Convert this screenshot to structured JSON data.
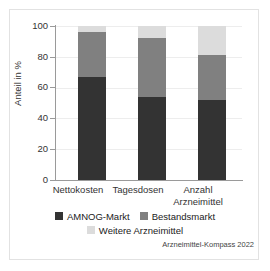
{
  "chart_data": {
    "type": "bar",
    "stacked": true,
    "title": "",
    "xlabel": "",
    "ylabel": "Anteil in %",
    "ylim": [
      0,
      100
    ],
    "yticks": [
      0,
      20,
      40,
      60,
      80,
      100
    ],
    "ytick_labels": [
      "0",
      "20",
      "40",
      "60",
      "80",
      "100"
    ],
    "grid": true,
    "legend_position": "bottom",
    "categories": [
      "Nettokosten",
      "Tagesdosen",
      "Anzahl Arzneimittel"
    ],
    "category_lines": [
      [
        "Nettokosten"
      ],
      [
        "Tagesdosen"
      ],
      [
        "Anzahl",
        "Arzneimittel"
      ]
    ],
    "series": [
      {
        "name": "AMNOG-Markt",
        "color": "#333333",
        "values": [
          67,
          54,
          52
        ]
      },
      {
        "name": "Bestandsmarkt",
        "color": "#808080",
        "values": [
          29,
          38,
          29
        ]
      },
      {
        "name": "Weitere Arzneimittel",
        "color": "#dcdcdc",
        "values": [
          4,
          8,
          19
        ]
      }
    ],
    "cumulative_tops": [
      [
        67,
        96,
        100
      ],
      [
        54,
        92,
        100
      ],
      [
        52,
        81,
        100
      ]
    ],
    "source": "Arzneimittel-Kompass 2022"
  },
  "colors": {
    "amnog_markt": "#333333",
    "bestandsmarkt": "#808080",
    "weitere_arzneimittel": "#dcdcdc",
    "axis": "#9a9a9a",
    "grid": "#ededed",
    "frame": "#e2e2e2",
    "background": "#ffffff"
  },
  "axis": {
    "y_label": "Anteil in %",
    "y_ticks": [
      "100",
      "80",
      "60",
      "40",
      "20",
      "0"
    ]
  },
  "legend": {
    "items": [
      {
        "label": "AMNOG-Markt",
        "color": "#333333"
      },
      {
        "label": "Bestandsmarkt",
        "color": "#808080"
      },
      {
        "label": "Weitere Arzneimittel",
        "color": "#dcdcdc"
      }
    ]
  },
  "footer": {
    "source": "Arzneimittel-Kompass 2022"
  }
}
